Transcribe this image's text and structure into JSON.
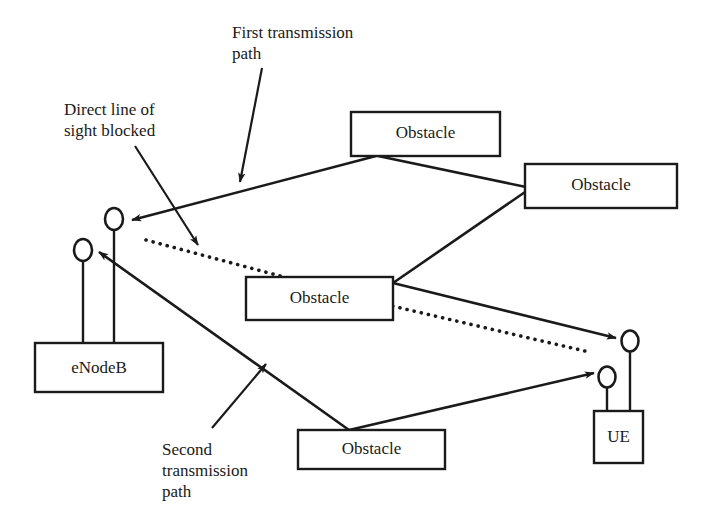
{
  "figure": {
    "type": "network-propagation-diagram",
    "title": "",
    "background_color": "#ffffff",
    "stroke_color": "#1a1a1a",
    "width": 702,
    "height": 528
  },
  "nodes": {
    "enodeb": {
      "label": "eNodeB",
      "box": {
        "x": 35,
        "y": 343,
        "w": 128,
        "h": 49
      },
      "antennas": [
        {
          "name": "enodeb-antenna-tall",
          "cx": 114,
          "cy": 219,
          "rx": 9,
          "ry": 11,
          "mast_bottom": 343
        },
        {
          "name": "enodeb-antenna-short",
          "cx": 83,
          "cy": 250,
          "rx": 9,
          "ry": 11,
          "mast_bottom": 343
        }
      ]
    },
    "ue": {
      "label": "UE",
      "box": {
        "x": 594,
        "y": 411,
        "w": 49,
        "h": 52
      },
      "antennas": [
        {
          "name": "ue-antenna-tall",
          "cx": 630,
          "cy": 341,
          "rx": 8.5,
          "ry": 10.5,
          "mast_bottom": 411
        },
        {
          "name": "ue-antenna-short",
          "cx": 607,
          "cy": 377,
          "rx": 8.5,
          "ry": 10.5,
          "mast_bottom": 411
        }
      ]
    }
  },
  "obstacles": [
    {
      "id": "obstacle-top",
      "label": "Obstacle",
      "box": {
        "x": 351,
        "y": 112,
        "w": 149,
        "h": 44
      }
    },
    {
      "id": "obstacle-right",
      "label": "Obstacle",
      "box": {
        "x": 525,
        "y": 164,
        "w": 152,
        "h": 44
      }
    },
    {
      "id": "obstacle-center",
      "label": "Obstacle",
      "box": {
        "x": 246,
        "y": 277,
        "w": 147,
        "h": 43
      }
    },
    {
      "id": "obstacle-bottom",
      "label": "Obstacle",
      "box": {
        "x": 298,
        "y": 430,
        "w": 147,
        "h": 39
      }
    }
  ],
  "paths": {
    "first_transmission": {
      "name": "first-transmission-path",
      "style": "solid",
      "segments": [
        {
          "from": "obstacle-top-bottom-left",
          "to": "enodeb-antenna-tall",
          "arrow_at": "enodeb-antenna-tall"
        },
        {
          "from": "obstacle-top-bottom-right",
          "to": "obstacle-right-left-edge",
          "arrow_at": "none"
        },
        {
          "from": "obstacle-right-bottom-left",
          "to": "obstacle-center-right-edge",
          "arrow_at": "none"
        },
        {
          "from": "obstacle-center-right-edge",
          "to": "ue-antenna-tall",
          "arrow_at": "ue-antenna-tall"
        }
      ]
    },
    "second_transmission": {
      "name": "second-transmission-path",
      "style": "solid",
      "segments": [
        {
          "from": "obstacle-bottom-top-center",
          "to": "enodeb-antenna-short",
          "arrow_at": "enodeb-antenna-short"
        },
        {
          "from": "obstacle-bottom-top-center",
          "to": "ue-antenna-short",
          "arrow_at": "ue-antenna-short"
        }
      ]
    },
    "direct_line_of_sight": {
      "name": "direct-line-of-sight",
      "style": "dotted",
      "from": "enodeb",
      "to": "ue",
      "blocked": true
    }
  },
  "callouts": [
    {
      "id": "label-first-path",
      "name": "callout-first-transmission-path",
      "text": "First transmission\npath",
      "x": 232,
      "y": 22,
      "leader": {
        "x1": 262,
        "y1": 68,
        "x2": 240,
        "y2": 182
      }
    },
    {
      "id": "label-direct-los",
      "name": "callout-direct-line-of-sight-blocked",
      "text": "Direct line of\nsight blocked",
      "x": 64,
      "y": 99,
      "leader": {
        "x1": 135,
        "y1": 146,
        "x2": 198,
        "y2": 245
      }
    },
    {
      "id": "label-second-path",
      "name": "callout-second-transmission-path",
      "text": "Second\ntransmission\npath",
      "x": 162,
      "y": 439,
      "leader": {
        "x1": 212,
        "y1": 428,
        "x2": 264,
        "y2": 366
      }
    }
  ]
}
